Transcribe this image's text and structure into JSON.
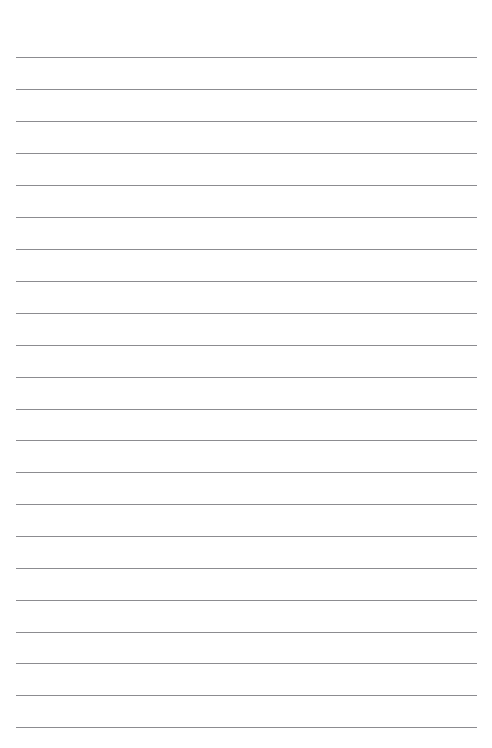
{
  "page": {
    "kind": "ruled-notebook-page",
    "background_color": "#ffffff",
    "width": 492,
    "height": 748
  },
  "ruling": {
    "line_color": "#8c8c90",
    "line_thickness": 1,
    "line_count": 22,
    "first_line_y": 57,
    "line_spacing": 31.9,
    "left_margin_x": 16,
    "right_margin_x": 477,
    "line_length": 461,
    "margin_rule": false,
    "header_space_above_first_line": 57,
    "footer_space_below_last_line": 21
  },
  "lines": [
    {
      "index": 1,
      "y": 57,
      "text": ""
    },
    {
      "index": 2,
      "y": 89,
      "text": ""
    },
    {
      "index": 3,
      "y": 121,
      "text": ""
    },
    {
      "index": 4,
      "y": 153,
      "text": ""
    },
    {
      "index": 5,
      "y": 185,
      "text": ""
    },
    {
      "index": 6,
      "y": 217,
      "text": ""
    },
    {
      "index": 7,
      "y": 249,
      "text": ""
    },
    {
      "index": 8,
      "y": 281,
      "text": ""
    },
    {
      "index": 9,
      "y": 313,
      "text": ""
    },
    {
      "index": 10,
      "y": 345,
      "text": ""
    },
    {
      "index": 11,
      "y": 377,
      "text": ""
    },
    {
      "index": 12,
      "y": 409,
      "text": ""
    },
    {
      "index": 13,
      "y": 440,
      "text": ""
    },
    {
      "index": 14,
      "y": 472,
      "text": ""
    },
    {
      "index": 15,
      "y": 504,
      "text": ""
    },
    {
      "index": 16,
      "y": 536,
      "text": ""
    },
    {
      "index": 17,
      "y": 568,
      "text": ""
    },
    {
      "index": 18,
      "y": 600,
      "text": ""
    },
    {
      "index": 19,
      "y": 632,
      "text": ""
    },
    {
      "index": 20,
      "y": 663,
      "text": ""
    },
    {
      "index": 21,
      "y": 695,
      "text": ""
    },
    {
      "index": 22,
      "y": 727,
      "text": ""
    }
  ]
}
